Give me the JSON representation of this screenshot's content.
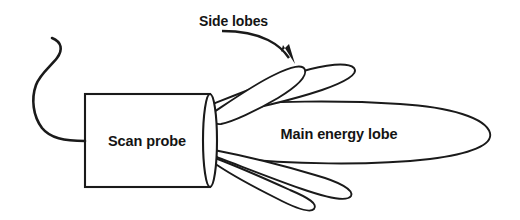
{
  "diagram": {
    "background_color": "#ffffff",
    "line_color": "#1a1a1a",
    "text_color": "#141414",
    "labels": {
      "probe": "Scan probe",
      "main_lobe": "Main energy lobe",
      "side_lobes": "Side lobes"
    },
    "annotation": {
      "arrow_from": "Side lobes",
      "arrow_points_to": "upper side lobe"
    },
    "elements": {
      "cable": "s-curved-cable",
      "probe_box": "rectangular-probe-housing",
      "probe_face": "elliptical-emitting-face",
      "main_lobe": "large-elongated-ellipse",
      "upper_side_lobe_inner": "narrow-lobe",
      "upper_side_lobe_outer": "narrow-lobe",
      "lower_side_lobe_inner": "narrow-lobe",
      "lower_side_lobe_outer": "narrow-lobe"
    },
    "counts": {
      "side_lobes_total": 4,
      "main_lobes_total": 1
    }
  }
}
